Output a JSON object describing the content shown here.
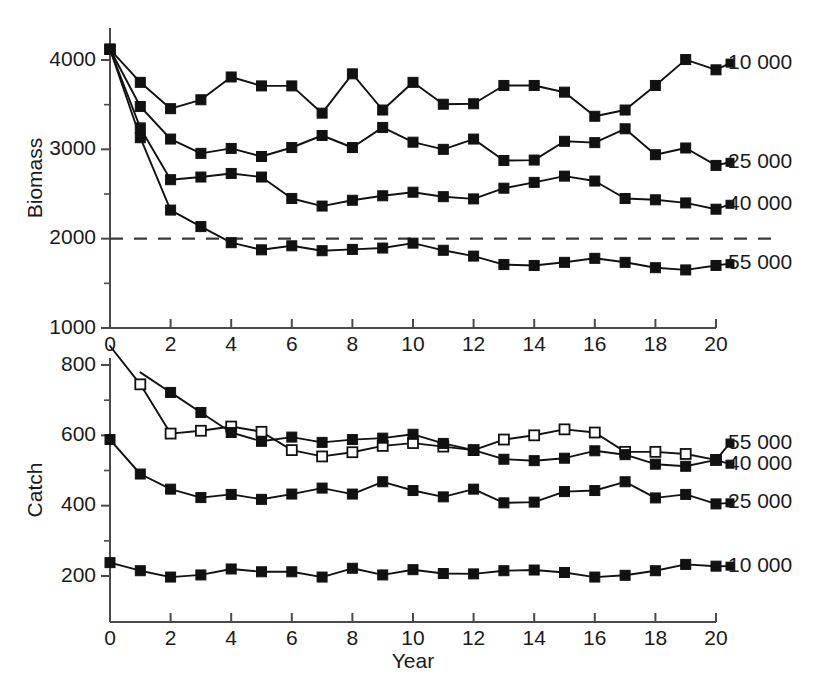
{
  "figure": {
    "background": "#ffffff",
    "line_color": "#111111",
    "axis_color": "#4a4a4a",
    "xlabel": "Year"
  },
  "chart_data": [
    {
      "type": "line",
      "panel": "top",
      "title": "",
      "xlabel": "",
      "ylabel": "Biomass",
      "x": [
        0,
        1,
        2,
        3,
        4,
        5,
        6,
        7,
        8,
        9,
        10,
        11,
        12,
        13,
        14,
        15,
        16,
        17,
        18,
        19,
        20
      ],
      "xlim": [
        0,
        20
      ],
      "ylim": [
        1000,
        4250
      ],
      "xticks": [
        0,
        2,
        4,
        6,
        8,
        10,
        12,
        14,
        16,
        18,
        20
      ],
      "xticklabels": [
        "0",
        "2",
        "4",
        "6",
        "8",
        "10",
        "12",
        "14",
        "16",
        "18",
        "20"
      ],
      "yticks": [
        1000,
        2000,
        3000,
        4000
      ],
      "yticklabels": [
        "1000",
        "2000",
        "3000",
        "4000"
      ],
      "yticks_minor": [
        1500,
        2500,
        3500
      ],
      "grid": false,
      "legend_position": "right-of-axes",
      "annotations": [
        {
          "kind": "reference-line",
          "style": "dashed",
          "y": 2000,
          "label": ""
        }
      ],
      "series": [
        {
          "name": "10 000",
          "marker": "filled-square",
          "label": "10 000",
          "label_y": 3965,
          "values": [
            4120,
            3750,
            3455,
            3555,
            3810,
            3710,
            3710,
            3405,
            3845,
            3440,
            3750,
            3505,
            3510,
            3715,
            3715,
            3640,
            3370,
            3440,
            3715,
            4005,
            3890
          ]
        },
        {
          "name": "25 000",
          "marker": "filled-square",
          "label": "25 000",
          "label_y": 2855,
          "values": [
            4120,
            3480,
            3115,
            2955,
            3010,
            2920,
            3020,
            3155,
            3020,
            3245,
            3080,
            3000,
            3115,
            2875,
            2880,
            3090,
            3075,
            3230,
            2940,
            3015,
            2820
          ]
        },
        {
          "name": "40 000",
          "marker": "filled-square",
          "label": "40 000",
          "label_y": 2385,
          "values": [
            4120,
            3240,
            2660,
            2690,
            2730,
            2690,
            2450,
            2365,
            2430,
            2480,
            2520,
            2470,
            2445,
            2565,
            2630,
            2700,
            2645,
            2450,
            2435,
            2400,
            2330
          ]
        },
        {
          "name": "55 000",
          "marker": "filled-square",
          "label": "55 000",
          "label_y": 1720,
          "values": [
            4120,
            3130,
            2320,
            2135,
            1955,
            1875,
            1920,
            1865,
            1880,
            1895,
            1950,
            1870,
            1805,
            1710,
            1700,
            1735,
            1780,
            1735,
            1675,
            1650,
            1700
          ]
        }
      ]
    },
    {
      "type": "line",
      "panel": "bottom",
      "title": "",
      "xlabel": "Year",
      "ylabel": "Catch",
      "x": [
        0,
        1,
        2,
        3,
        4,
        5,
        6,
        7,
        8,
        9,
        10,
        11,
        12,
        13,
        14,
        15,
        16,
        17,
        18,
        19,
        20
      ],
      "xlim": [
        0,
        20
      ],
      "ylim": [
        100,
        820
      ],
      "xticks": [
        0,
        2,
        4,
        6,
        8,
        10,
        12,
        14,
        16,
        18,
        20
      ],
      "xticklabels": [
        "0",
        "2",
        "4",
        "6",
        "8",
        "10",
        "12",
        "14",
        "16",
        "18",
        "20"
      ],
      "yticks": [
        200,
        400,
        600,
        800
      ],
      "yticklabels": [
        "200",
        "400",
        "600",
        "800"
      ],
      "yticks_minor": [
        300,
        500,
        700
      ],
      "grid": false,
      "legend_position": "right-of-axes",
      "series": [
        {
          "name": "55 000",
          "marker": "open-square",
          "label": "55 000",
          "label_y": 578,
          "values": [
            null,
            745,
            605,
            613,
            625,
            610,
            558,
            540,
            552,
            570,
            578,
            568,
            558,
            588,
            600,
            617,
            608,
            553,
            553,
            547,
            530
          ]
        },
        {
          "name": "40 000",
          "marker": "filled-square",
          "label": "40 000",
          "label_y": 518,
          "values": [
            null,
            null,
            722,
            665,
            608,
            583,
            595,
            580,
            588,
            592,
            603,
            577,
            558,
            532,
            528,
            535,
            556,
            545,
            518,
            512,
            530
          ]
        },
        {
          "name": "25 000",
          "marker": "filled-square",
          "label": "25 000",
          "label_y": 408,
          "values": [
            588,
            490,
            447,
            423,
            432,
            418,
            433,
            450,
            433,
            468,
            443,
            425,
            447,
            408,
            410,
            440,
            443,
            468,
            422,
            432,
            405
          ]
        },
        {
          "name": "10 000",
          "marker": "filled-square",
          "label": "10 000",
          "label_y": 228,
          "values": [
            238,
            215,
            197,
            203,
            220,
            212,
            212,
            197,
            222,
            203,
            218,
            207,
            206,
            215,
            217,
            210,
            197,
            202,
            215,
            233,
            228
          ]
        }
      ]
    }
  ]
}
